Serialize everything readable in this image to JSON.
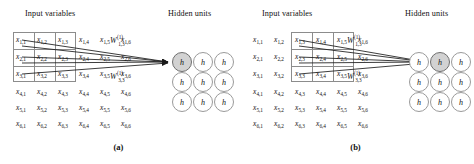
{
  "figure": {
    "caption_a": "(a)",
    "caption_b": "(b)",
    "colors": {
      "active_unit": "#d2d2d2",
      "unit_stroke": "#9a9a9a",
      "box_stroke": "#8c8c8c",
      "arrow": "#1a1a1a",
      "background": "#ffffff"
    }
  },
  "headers": {
    "input_variables": "Input variables",
    "hidden_units": "Hidden units"
  },
  "input_grid": {
    "rows": 6,
    "cols": 6,
    "symbol": "x",
    "cells": [
      [
        "x1,1",
        "x1,2",
        "x1,3",
        "x1,4",
        "x1,5",
        "x1,6"
      ],
      [
        "x2,1",
        "x2,2",
        "x2,3",
        "x2,4",
        "x2,5",
        "x2,6"
      ],
      [
        "x3,1",
        "x3,2",
        "x3,3",
        "x3,4",
        "x3,5",
        "x3,6"
      ],
      [
        "x4,1",
        "x4,2",
        "x4,3",
        "x4,4",
        "x4,5",
        "x4,6"
      ],
      [
        "x5,1",
        "x5,2",
        "x5,3",
        "x5,4",
        "x5,5",
        "x5,6"
      ],
      [
        "x6,1",
        "x6,2",
        "x6,3",
        "x6,4",
        "x6,5",
        "x6,6"
      ]
    ],
    "subscripts": [
      [
        "1,1",
        "1,2",
        "1,3",
        "1,4",
        "1,5",
        "1,6"
      ],
      [
        "2,1",
        "2,2",
        "2,3",
        "2,4",
        "2,5",
        "2,6"
      ],
      [
        "3,1",
        "3,2",
        "3,3",
        "3,4",
        "3,5",
        "3,6"
      ],
      [
        "4,1",
        "4,2",
        "4,3",
        "4,4",
        "4,5",
        "4,6"
      ],
      [
        "5,1",
        "5,2",
        "5,3",
        "5,4",
        "5,5",
        "5,6"
      ],
      [
        "6,1",
        "6,2",
        "6,3",
        "6,4",
        "6,5",
        "6,6"
      ]
    ]
  },
  "hidden_units": {
    "rows": 3,
    "cols": 3,
    "label": "h",
    "labels": [
      [
        "h",
        "h",
        "h"
      ],
      [
        "h",
        "h",
        "h"
      ],
      [
        "h",
        "h",
        "h"
      ]
    ]
  },
  "panel_a": {
    "caption": "(a)",
    "receptive_field": {
      "row_start": 1,
      "row_end": 3,
      "col_start": 1,
      "col_end": 3
    },
    "active_unit": {
      "row": 1,
      "col": 1
    },
    "weights": [
      {
        "symbol": "W",
        "superscript": "(1)",
        "subscript": "1,3"
      },
      {
        "symbol": "W",
        "superscript": "(1)",
        "subscript": "3,3"
      }
    ]
  },
  "panel_b": {
    "caption": "(b)",
    "receptive_field": {
      "row_start": 1,
      "row_end": 3,
      "col_start": 3,
      "col_end": 5
    },
    "active_unit": {
      "row": 1,
      "col": 2
    },
    "weights": [
      {
        "symbol": "W",
        "superscript": "(1)",
        "subscript": "1,3"
      },
      {
        "symbol": "W",
        "superscript": "(1)",
        "subscript": "3,3"
      }
    ]
  }
}
